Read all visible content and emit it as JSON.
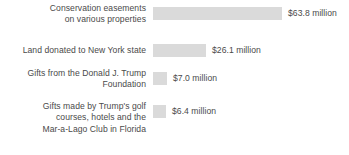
{
  "chart_data": {
    "type": "bar",
    "orientation": "horizontal",
    "title": "",
    "subtitle": "",
    "xlabel": "",
    "ylabel": "",
    "grid": false,
    "legend": null,
    "axis_visible": false,
    "units": "millions of dollars",
    "bar_color": "#dadada",
    "text_color": "#4a4a4a",
    "background": "#ffffff",
    "xlim": [
      0,
      63.8
    ],
    "categories": [
      "Conservation easements\non various properties",
      "Land donated to New York state",
      "Gifts from the Donald J. Trump\nFoundation",
      "Gifts made by Trump's golf\ncourses, hotels and the\nMar-a-Lago Club in Florida"
    ],
    "values": [
      63.8,
      26.1,
      7.0,
      6.4
    ],
    "value_labels": [
      "$63.8 million",
      "$26.1 million",
      "$7.0 million",
      "$6.4 million"
    ],
    "bar_pixel_widths": [
      129,
      53,
      14,
      13
    ]
  },
  "rows": [
    {
      "category": "Conservation easements\non various properties",
      "value": 63.8,
      "value_label": "$63.8 million",
      "bar_width_px": 129
    },
    {
      "category": "Land donated to New York state",
      "value": 26.1,
      "value_label": "$26.1 million",
      "bar_width_px": 53
    },
    {
      "category": "Gifts from the Donald J. Trump\nFoundation",
      "value": 7.0,
      "value_label": "$7.0 million",
      "bar_width_px": 14
    },
    {
      "category": "Gifts made by Trump's golf\ncourses, hotels and the\nMar-a-Lago Club in Florida",
      "value": 6.4,
      "value_label": "$6.4 million",
      "bar_width_px": 13
    }
  ]
}
